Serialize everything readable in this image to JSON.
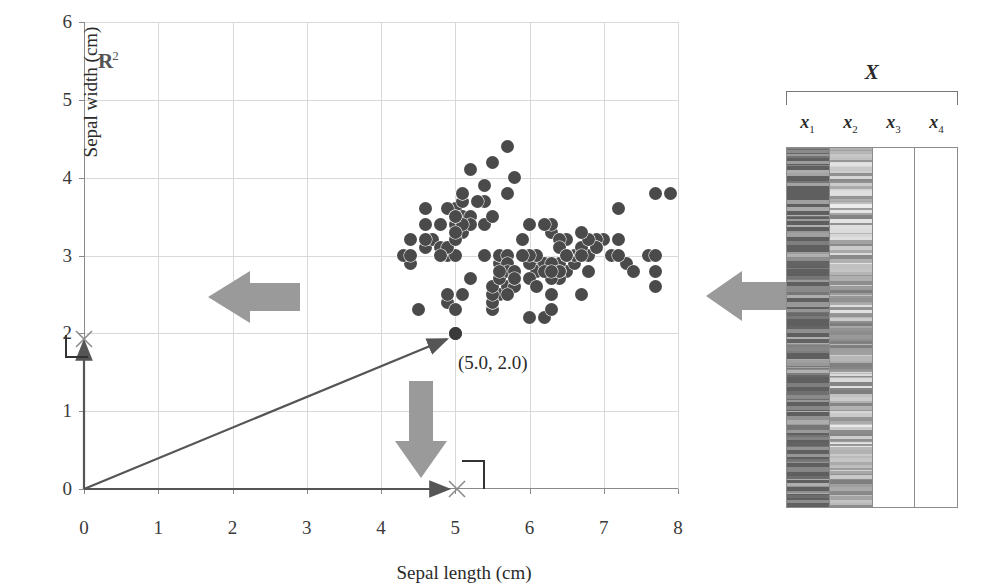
{
  "figure": {
    "domain_label": "R",
    "domain_exponent": "2",
    "point_label": "(5.0, 2.0)"
  },
  "plot": {
    "x_axis_title": "Sepal length (cm)",
    "y_axis_title": "Sepal width (cm)",
    "x_ticks": [
      "0",
      "1",
      "2",
      "3",
      "4",
      "5",
      "6",
      "7",
      "8"
    ],
    "y_ticks": [
      "0",
      "1",
      "2",
      "3",
      "4",
      "5",
      "6"
    ],
    "x_range": [
      0,
      8
    ],
    "y_range": [
      0,
      6
    ],
    "marker_color": "#4a4a4a",
    "grid_color": "#d9d9d9",
    "axis_color": "#8a8a8a",
    "arrow_color": "#9a9a9a",
    "vector_color": "#555555"
  },
  "matrix": {
    "title": "X",
    "columns": [
      {
        "label": "x",
        "sub": "1",
        "filled": true
      },
      {
        "label": "x",
        "sub": "2",
        "filled": true
      },
      {
        "label": "x",
        "sub": "3",
        "filled": false
      },
      {
        "label": "x",
        "sub": "4",
        "filled": false
      }
    ]
  },
  "chart_data": {
    "type": "scatter",
    "title": "",
    "xlabel": "Sepal length (cm)",
    "ylabel": "Sepal width (cm)",
    "xlim": [
      0,
      8
    ],
    "ylim": [
      0,
      6
    ],
    "grid": true,
    "legend": "none",
    "annotations": [
      {
        "text": "R^2",
        "x": 0.25,
        "y": 5.55
      },
      {
        "text": "(5.0, 2.0)",
        "x": 5.1,
        "y": 1.78
      }
    ],
    "highlighted_point": {
      "x": 5.0,
      "y": 2.0,
      "label": "(5.0, 2.0)"
    },
    "arrows": [
      {
        "name": "vector-from-origin",
        "from": [
          0,
          0
        ],
        "to": [
          5.0,
          2.0
        ],
        "style": "thin-line"
      },
      {
        "name": "projection-to-x-axis",
        "from": [
          0,
          0
        ],
        "to": [
          5.0,
          0
        ],
        "style": "thin-line"
      },
      {
        "name": "projection-to-y-axis",
        "from": [
          0,
          0
        ],
        "to": [
          0,
          2.0
        ],
        "style": "thin-line"
      },
      {
        "name": "drop-arrow-to-x",
        "from": [
          4.95,
          1.55
        ],
        "to": [
          4.95,
          0.15
        ],
        "style": "gray-block-down"
      },
      {
        "name": "matrix-to-plot-arrow",
        "from": [
          9.2,
          2.55
        ],
        "to": [
          8.25,
          2.55
        ],
        "style": "gray-block-left"
      },
      {
        "name": "plot-to-vector-arrow",
        "from": [
          3.1,
          2.55
        ],
        "to": [
          2.15,
          2.55
        ],
        "style": "gray-block-left"
      }
    ],
    "points": [
      [
        5.1,
        3.5
      ],
      [
        4.9,
        3.0
      ],
      [
        4.7,
        3.2
      ],
      [
        4.6,
        3.1
      ],
      [
        5.0,
        3.6
      ],
      [
        5.4,
        3.9
      ],
      [
        4.6,
        3.4
      ],
      [
        5.0,
        3.4
      ],
      [
        4.4,
        2.9
      ],
      [
        4.9,
        3.1
      ],
      [
        5.4,
        3.7
      ],
      [
        4.8,
        3.4
      ],
      [
        4.8,
        3.0
      ],
      [
        4.3,
        3.0
      ],
      [
        5.8,
        4.0
      ],
      [
        5.7,
        4.4
      ],
      [
        5.4,
        3.9
      ],
      [
        5.1,
        3.5
      ],
      [
        5.7,
        3.8
      ],
      [
        5.1,
        3.8
      ],
      [
        5.4,
        3.4
      ],
      [
        5.1,
        3.7
      ],
      [
        4.6,
        3.6
      ],
      [
        5.1,
        3.3
      ],
      [
        4.8,
        3.4
      ],
      [
        5.0,
        3.0
      ],
      [
        5.0,
        3.4
      ],
      [
        5.2,
        3.5
      ],
      [
        5.2,
        3.4
      ],
      [
        4.7,
        3.2
      ],
      [
        4.8,
        3.1
      ],
      [
        5.4,
        3.4
      ],
      [
        5.2,
        4.1
      ],
      [
        5.5,
        4.2
      ],
      [
        4.9,
        3.1
      ],
      [
        5.0,
        3.2
      ],
      [
        5.5,
        3.5
      ],
      [
        4.9,
        3.6
      ],
      [
        4.4,
        3.0
      ],
      [
        5.1,
        3.4
      ],
      [
        5.0,
        3.5
      ],
      [
        4.5,
        2.3
      ],
      [
        4.4,
        3.2
      ],
      [
        5.0,
        3.5
      ],
      [
        5.1,
        3.8
      ],
      [
        4.8,
        3.0
      ],
      [
        5.1,
        3.8
      ],
      [
        4.6,
        3.2
      ],
      [
        5.3,
        3.7
      ],
      [
        5.0,
        3.3
      ],
      [
        7.0,
        3.2
      ],
      [
        6.4,
        3.2
      ],
      [
        6.9,
        3.1
      ],
      [
        5.5,
        2.3
      ],
      [
        6.5,
        2.8
      ],
      [
        5.7,
        2.8
      ],
      [
        6.3,
        3.3
      ],
      [
        4.9,
        2.4
      ],
      [
        6.6,
        2.9
      ],
      [
        5.2,
        2.7
      ],
      [
        5.0,
        2.0
      ],
      [
        5.9,
        3.0
      ],
      [
        6.0,
        2.2
      ],
      [
        6.1,
        2.9
      ],
      [
        5.6,
        2.9
      ],
      [
        6.7,
        3.1
      ],
      [
        5.6,
        3.0
      ],
      [
        5.8,
        2.7
      ],
      [
        6.2,
        2.2
      ],
      [
        5.6,
        2.5
      ],
      [
        5.9,
        3.2
      ],
      [
        6.1,
        2.8
      ],
      [
        6.3,
        2.5
      ],
      [
        6.1,
        2.8
      ],
      [
        6.4,
        2.9
      ],
      [
        6.6,
        3.0
      ],
      [
        6.8,
        2.8
      ],
      [
        6.7,
        3.0
      ],
      [
        6.0,
        2.9
      ],
      [
        5.7,
        2.6
      ],
      [
        5.5,
        2.4
      ],
      [
        5.5,
        2.4
      ],
      [
        5.8,
        2.7
      ],
      [
        6.0,
        2.7
      ],
      [
        5.4,
        3.0
      ],
      [
        6.0,
        3.4
      ],
      [
        6.7,
        3.1
      ],
      [
        6.3,
        2.3
      ],
      [
        5.6,
        3.0
      ],
      [
        5.5,
        2.5
      ],
      [
        5.5,
        2.6
      ],
      [
        6.1,
        3.0
      ],
      [
        5.8,
        2.6
      ],
      [
        5.0,
        2.3
      ],
      [
        5.6,
        2.7
      ],
      [
        5.7,
        3.0
      ],
      [
        5.7,
        2.9
      ],
      [
        6.2,
        2.9
      ],
      [
        5.1,
        2.5
      ],
      [
        5.7,
        2.8
      ],
      [
        6.3,
        3.3
      ],
      [
        5.8,
        2.7
      ],
      [
        7.1,
        3.0
      ],
      [
        6.3,
        2.9
      ],
      [
        6.5,
        3.0
      ],
      [
        7.6,
        3.0
      ],
      [
        4.9,
        2.5
      ],
      [
        7.3,
        2.9
      ],
      [
        6.7,
        2.5
      ],
      [
        7.2,
        3.6
      ],
      [
        6.5,
        3.2
      ],
      [
        6.4,
        2.7
      ],
      [
        6.8,
        3.0
      ],
      [
        5.7,
        2.5
      ],
      [
        5.8,
        2.8
      ],
      [
        6.4,
        3.2
      ],
      [
        6.5,
        3.0
      ],
      [
        7.7,
        3.8
      ],
      [
        7.7,
        2.6
      ],
      [
        6.0,
        2.2
      ],
      [
        6.9,
        3.2
      ],
      [
        5.6,
        2.8
      ],
      [
        7.7,
        2.8
      ],
      [
        6.3,
        2.7
      ],
      [
        6.7,
        3.3
      ],
      [
        7.2,
        3.2
      ],
      [
        6.2,
        2.8
      ],
      [
        6.1,
        3.0
      ],
      [
        6.4,
        2.8
      ],
      [
        7.2,
        3.0
      ],
      [
        7.4,
        2.8
      ],
      [
        7.9,
        3.8
      ],
      [
        6.4,
        2.8
      ],
      [
        6.3,
        2.8
      ],
      [
        6.1,
        2.6
      ],
      [
        7.7,
        3.0
      ],
      [
        6.3,
        3.4
      ],
      [
        6.4,
        3.1
      ],
      [
        6.0,
        3.0
      ],
      [
        6.9,
        3.1
      ],
      [
        6.7,
        3.1
      ],
      [
        6.9,
        3.1
      ],
      [
        5.8,
        2.7
      ],
      [
        6.8,
        3.2
      ],
      [
        6.7,
        3.3
      ],
      [
        6.7,
        3.0
      ],
      [
        6.3,
        2.5
      ],
      [
        6.5,
        3.0
      ],
      [
        6.2,
        3.4
      ],
      [
        5.9,
        3.0
      ]
    ]
  }
}
